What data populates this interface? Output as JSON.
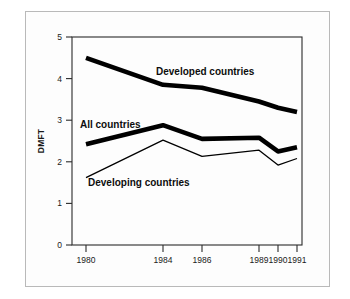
{
  "chart_data": {
    "type": "line",
    "title": "",
    "xlabel": "",
    "ylabel": "DMFT",
    "x": [
      1980,
      1984,
      1986,
      1989,
      1990,
      1991
    ],
    "categories": [
      "1980",
      "1984",
      "1986",
      "1989",
      "1990",
      "1991"
    ],
    "xtick_labels": [
      "1980",
      "1984",
      "1986",
      "1989",
      "1990",
      "1991"
    ],
    "ytick_labels": [
      "0",
      "1",
      "2",
      "3",
      "4",
      "5"
    ],
    "yticks": [
      0,
      1,
      2,
      3,
      4,
      5
    ],
    "ylim": [
      0,
      5
    ],
    "grid": false,
    "legend_position": "inline-annotations",
    "series": [
      {
        "name": "Developed countries",
        "label": "Developed countries",
        "style": "thick",
        "color": "#000000",
        "values": [
          4.5,
          3.85,
          3.78,
          3.45,
          3.3,
          3.2
        ]
      },
      {
        "name": "All countries",
        "label": "All countries",
        "style": "thick",
        "color": "#000000",
        "values": [
          2.42,
          2.88,
          2.55,
          2.58,
          2.25,
          2.35
        ]
      },
      {
        "name": "Developing countries",
        "label": "Developing countries",
        "style": "thin",
        "color": "#000000",
        "values": [
          1.62,
          2.52,
          2.13,
          2.28,
          1.92,
          2.08
        ]
      }
    ],
    "annotations": [
      {
        "text": "Developed countries",
        "x": 1985.2,
        "y": 4.15
      },
      {
        "text": "All countries",
        "x": 1980.6,
        "y": 3.0
      },
      {
        "text": "Developing countries",
        "x": 1981.2,
        "y": 1.72
      }
    ]
  },
  "axis": {
    "y_title": "DMFT",
    "y_labels": [
      "5",
      "4",
      "3",
      "2",
      "1",
      "0"
    ],
    "x_labels": [
      "1980",
      "1984",
      "1986",
      "1989",
      "1990",
      "1991"
    ]
  },
  "labels": {
    "developed": "Developed countries",
    "all": "All countries",
    "developing": "Developing countries"
  }
}
